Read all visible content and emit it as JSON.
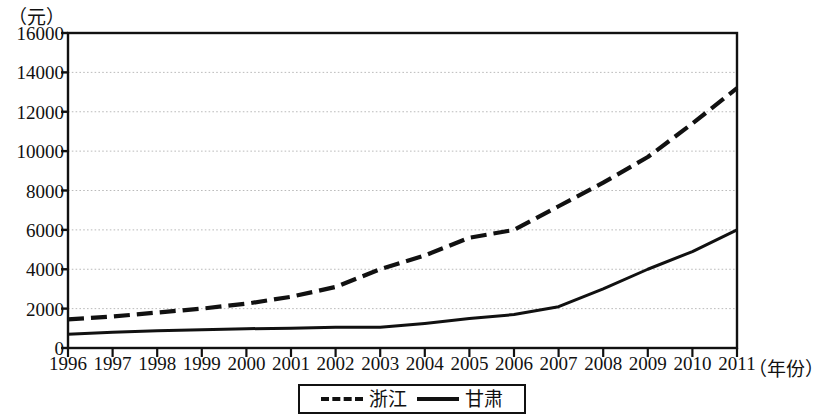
{
  "chart_data": {
    "type": "line",
    "title": "",
    "subtitle": "",
    "xlabel": "（年份）",
    "ylabel": "（元）",
    "x": [
      1996,
      1997,
      1998,
      1999,
      2000,
      2001,
      2002,
      2003,
      2004,
      2005,
      2006,
      2007,
      2008,
      2009,
      2010,
      2011
    ],
    "categories": [
      "1996",
      "1997",
      "1998",
      "1999",
      "2000",
      "2001",
      "2002",
      "2003",
      "2004",
      "2005",
      "2006",
      "2007",
      "2008",
      "2009",
      "2010",
      "2011"
    ],
    "series": [
      {
        "name": "浙江",
        "style": "dashed",
        "color": "#111111",
        "values": [
          1450,
          1600,
          1800,
          2000,
          2250,
          2600,
          3100,
          4000,
          4700,
          5600,
          6000,
          7200,
          8400,
          9700,
          11400,
          13200
        ]
      },
      {
        "name": "甘肃",
        "style": "solid",
        "color": "#111111",
        "values": [
          700,
          800,
          870,
          930,
          980,
          1000,
          1050,
          1050,
          1250,
          1500,
          1700,
          2100,
          3000,
          4000,
          4900,
          6000
        ]
      }
    ],
    "xlim": [
      1996,
      2011
    ],
    "ylim": [
      0,
      16000
    ],
    "yticks": [
      0,
      2000,
      4000,
      6000,
      8000,
      10000,
      12000,
      14000,
      16000
    ],
    "ytick_labels": [
      "0",
      "2000",
      "4000",
      "6000",
      "8000",
      "10000",
      "12000",
      "14000",
      "16000"
    ],
    "grid": "horizontal-dotted",
    "grid_color": "#bbbbbb",
    "axis_color": "#111111",
    "legend_position": "bottom-center"
  },
  "legend": {
    "entries": [
      {
        "label": "浙江",
        "style": "dashed"
      },
      {
        "label": "甘肃",
        "style": "solid"
      }
    ]
  }
}
